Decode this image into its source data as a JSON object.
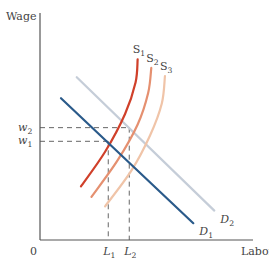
{
  "chart_data": {
    "type": "line",
    "title": "",
    "xlabel": "Labor",
    "ylabel": "Wage",
    "origin_label": "0",
    "xlim": [
      0,
      100
    ],
    "ylim": [
      0,
      100
    ],
    "grid": false,
    "legend": "inline",
    "colors": {
      "axis": "#555555",
      "D1": "#2a5a8a",
      "D2": "#c5cdd8",
      "S1": "#d0402a",
      "S2": "#e59070",
      "S3": "#f0c4a8",
      "guide": "#666666"
    },
    "series": [
      {
        "name": "D1",
        "label_main": "D",
        "label_sub": "1",
        "kind": "demand",
        "points": [
          [
            10,
            67.5
          ],
          [
            73,
            8
          ]
        ]
      },
      {
        "name": "D2",
        "label_main": "D",
        "label_sub": "2",
        "kind": "demand",
        "points": [
          [
            17.5,
            77.5
          ],
          [
            83,
            14
          ]
        ]
      },
      {
        "name": "S1",
        "label_main": "S",
        "label_sub": "1",
        "kind": "supply",
        "points": [
          [
            19.5,
            25.5
          ],
          [
            31,
            42
          ],
          [
            40.5,
            60
          ],
          [
            45.5,
            75
          ],
          [
            46.5,
            86
          ]
        ]
      },
      {
        "name": "S2",
        "label_main": "S",
        "label_sub": "2",
        "kind": "supply",
        "points": [
          [
            24.5,
            20.5
          ],
          [
            37,
            38
          ],
          [
            46.5,
            55
          ],
          [
            51.5,
            70
          ],
          [
            53,
            82
          ]
        ]
      },
      {
        "name": "S3",
        "label_main": "S",
        "label_sub": "3",
        "kind": "supply",
        "points": [
          [
            31,
            16
          ],
          [
            43.5,
            33
          ],
          [
            52.5,
            50
          ],
          [
            58,
            65
          ],
          [
            59.5,
            78
          ]
        ]
      }
    ],
    "guides": {
      "w1": {
        "label_main": "w",
        "label_sub": "1",
        "value": 47
      },
      "w2": {
        "label_main": "w",
        "label_sub": "2",
        "value": 53.5
      },
      "L1": {
        "label_main": "L",
        "label_sub": "1",
        "value": 32.5
      },
      "L2": {
        "label_main": "L",
        "label_sub": "2",
        "value": 42.5
      }
    }
  }
}
